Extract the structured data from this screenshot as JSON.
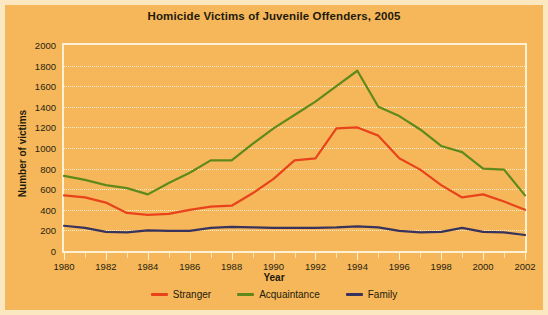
{
  "chart_data": {
    "type": "line",
    "title": "Homicide Victims of Juvenile Offenders, 2005",
    "xlabel": "Year",
    "ylabel": "Number of victims",
    "xlim": [
      1980,
      2002
    ],
    "ylim": [
      0,
      2000
    ],
    "ytick_step": 200,
    "xtick_step": 2,
    "grid": true,
    "legend_position": "bottom-center",
    "background_color": "#f5b75a",
    "plot_border_color": "#fdf0d4",
    "gridline_color": "#fdf2da",
    "x": [
      1980,
      1981,
      1982,
      1983,
      1984,
      1985,
      1986,
      1987,
      1988,
      1989,
      1990,
      1991,
      1992,
      1993,
      1994,
      1995,
      1996,
      1997,
      1998,
      1999,
      2000,
      2001,
      2002
    ],
    "xtick_labels": [
      "1980",
      "1982",
      "1984",
      "1986",
      "1988",
      "1990",
      "1992",
      "1994",
      "1996",
      "1998",
      "2000",
      "2002"
    ],
    "ytick_labels": [
      "0",
      "200",
      "400",
      "600",
      "800",
      "1000",
      "1200",
      "1400",
      "1600",
      "1800",
      "2000"
    ],
    "series": [
      {
        "name": "Stranger",
        "color": "#e8431a",
        "values": [
          540,
          520,
          470,
          370,
          350,
          360,
          400,
          430,
          440,
          560,
          700,
          880,
          900,
          1190,
          1200,
          1120,
          900,
          790,
          640,
          520,
          550,
          480,
          400
        ]
      },
      {
        "name": "Acquaintance",
        "color": "#5f8a1b",
        "values": [
          730,
          690,
          640,
          610,
          550,
          660,
          760,
          880,
          880,
          1040,
          1190,
          1320,
          1450,
          1600,
          1750,
          1400,
          1310,
          1180,
          1020,
          960,
          800,
          790,
          540
        ]
      },
      {
        "name": "Family",
        "color": "#37335c",
        "values": [
          245,
          225,
          185,
          180,
          200,
          195,
          195,
          225,
          235,
          230,
          225,
          225,
          225,
          230,
          240,
          230,
          195,
          180,
          185,
          225,
          185,
          180,
          155
        ]
      }
    ]
  },
  "legend": [
    {
      "label": "Stranger",
      "color": "#e8431a",
      "icon": "line-swatch-icon"
    },
    {
      "label": "Acquaintance",
      "color": "#5f8a1b",
      "icon": "line-swatch-icon"
    },
    {
      "label": "Family",
      "color": "#37335c",
      "icon": "line-swatch-icon"
    }
  ]
}
